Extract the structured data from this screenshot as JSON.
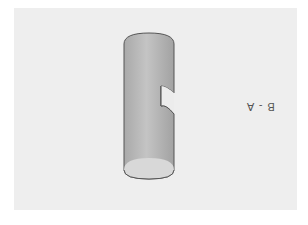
{
  "figure": {
    "label": "B - A",
    "colors": {
      "background": "#ffffff",
      "panel": "#eeeeee",
      "cylinder_body": "#b8b8b8",
      "cylinder_end": "#d6d6d6",
      "outline": "#555555"
    }
  }
}
